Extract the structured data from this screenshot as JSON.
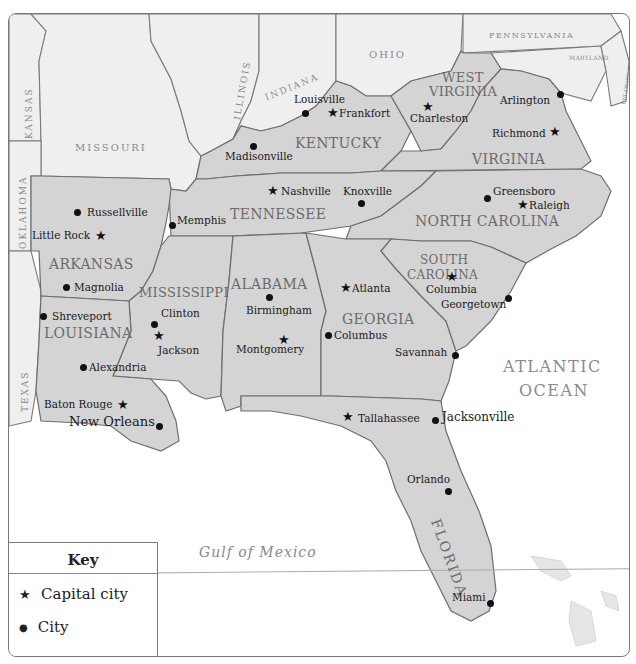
{
  "map": {
    "title": "Southeastern United States",
    "colors": {
      "target_state_fill": "#d4d4d4",
      "other_state_fill": "#efefef",
      "water": "#ffffff",
      "border": "#6e6e6e",
      "label_gray": "#6b6b6b"
    },
    "target_states": [
      {
        "name": "KENTUCKY"
      },
      {
        "name": "WEST VIRGINIA",
        "line1": "WEST",
        "line2": "VIRGINIA"
      },
      {
        "name": "VIRGINIA"
      },
      {
        "name": "TENNESSEE"
      },
      {
        "name": "NORTH CAROLINA"
      },
      {
        "name": "ARKANSAS"
      },
      {
        "name": "MISSISSIPPI"
      },
      {
        "name": "ALABAMA"
      },
      {
        "name": "GEORGIA"
      },
      {
        "name": "SOUTH CAROLINA",
        "line1": "SOUTH",
        "line2": "CAROLINA"
      },
      {
        "name": "LOUISIANA"
      },
      {
        "name": "FLORIDA"
      }
    ],
    "other_states": [
      "KANSAS",
      "MISSOURI",
      "ILLINOIS",
      "INDIANA",
      "OHIO",
      "PENNSYLVANIA",
      "MARYLAND",
      "DELAWARE",
      "OKLAHOMA",
      "TEXAS"
    ],
    "water_bodies": {
      "atlantic_line1": "ATLANTIC",
      "atlantic_line2": "OCEAN",
      "gulf": "Gulf of Mexico"
    },
    "capitals": [
      {
        "name": "Frankfort",
        "state": "Kentucky"
      },
      {
        "name": "Charleston",
        "state": "West Virginia"
      },
      {
        "name": "Richmond",
        "state": "Virginia"
      },
      {
        "name": "Nashville",
        "state": "Tennessee"
      },
      {
        "name": "Raleigh",
        "state": "North Carolina"
      },
      {
        "name": "Little Rock",
        "state": "Arkansas"
      },
      {
        "name": "Jackson",
        "state": "Mississippi"
      },
      {
        "name": "Montgomery",
        "state": "Alabama"
      },
      {
        "name": "Atlanta",
        "state": "Georgia"
      },
      {
        "name": "Columbia",
        "state": "South Carolina"
      },
      {
        "name": "Baton Rouge",
        "state": "Louisiana"
      },
      {
        "name": "Tallahassee",
        "state": "Florida"
      }
    ],
    "cities": [
      {
        "name": "Louisville"
      },
      {
        "name": "Madisonville"
      },
      {
        "name": "Arlington"
      },
      {
        "name": "Knoxville"
      },
      {
        "name": "Memphis"
      },
      {
        "name": "Greensboro"
      },
      {
        "name": "Russellville"
      },
      {
        "name": "Magnolia"
      },
      {
        "name": "Shreveport"
      },
      {
        "name": "Alexandria"
      },
      {
        "name": "New Orleans"
      },
      {
        "name": "Clinton"
      },
      {
        "name": "Birmingham"
      },
      {
        "name": "Columbus"
      },
      {
        "name": "Savannah"
      },
      {
        "name": "Georgetown"
      },
      {
        "name": "Jacksonville"
      },
      {
        "name": "Orlando"
      },
      {
        "name": "Miami"
      }
    ]
  },
  "key": {
    "title": "Key",
    "items": [
      {
        "symbol": "star",
        "glyph": "★",
        "label": "Capital city"
      },
      {
        "symbol": "dot",
        "glyph": "●",
        "label": "City"
      }
    ]
  }
}
